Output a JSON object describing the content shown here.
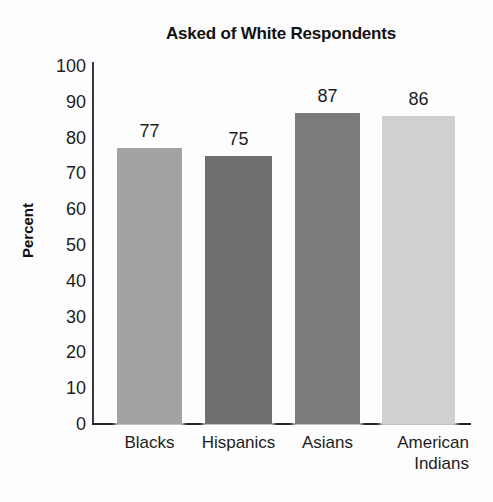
{
  "chart_data": {
    "type": "bar",
    "title": "Asked of White Respondents",
    "xlabel": "",
    "ylabel": "Percent",
    "categories": [
      "Blacks",
      "Hispanics",
      "Asians",
      "American\nIndians"
    ],
    "values": [
      77,
      75,
      87,
      86
    ],
    "value_labels": [
      "77",
      "75",
      "87",
      "86"
    ],
    "ylim": [
      0,
      100
    ],
    "ytick_labels": [
      "100",
      "90",
      "80",
      "70",
      "60",
      "50",
      "40",
      "30",
      "20",
      "10",
      "0"
    ],
    "ytick_values": [
      100,
      90,
      80,
      70,
      60,
      50,
      40,
      30,
      20,
      10,
      0
    ],
    "grid": false,
    "legend": "none",
    "bar_colors": [
      "#a3a3a3",
      "#6f6f6f",
      "#7b7b7b",
      "#d0d0d0"
    ],
    "axis_color": "#232323",
    "background_color": "#fdfdfd"
  }
}
